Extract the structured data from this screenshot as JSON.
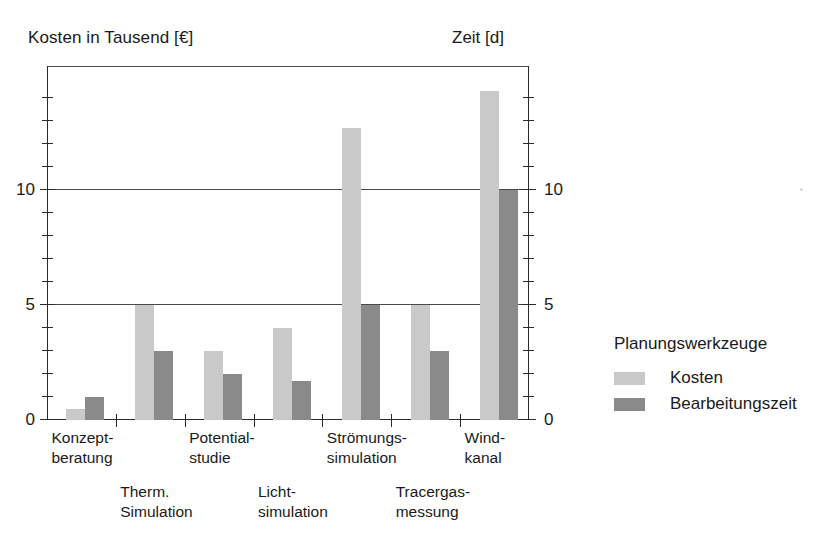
{
  "chart_data": {
    "type": "bar",
    "title": "",
    "ylabel": "Kosten in Tausend [€]",
    "y2label": "Zeit [d]",
    "xlabel": "",
    "ylim": [
      0,
      15.4
    ],
    "y2lim": [
      0,
      15.4
    ],
    "grid": true,
    "grid_values": [
      0,
      5,
      10
    ],
    "legend_position": "right",
    "legend_title": "Planungswerkzeuge",
    "y_ticks_major": [
      0,
      5,
      10
    ],
    "y_ticks_minor": [
      1,
      2,
      3,
      4,
      6,
      7,
      8,
      9,
      11,
      12,
      13,
      14
    ],
    "y_tick_labels": [
      "0",
      "5",
      "10"
    ],
    "y2_tick_labels": [
      "0",
      "5",
      "10"
    ],
    "categories": [
      "Konzept-beratung",
      "Therm. Simulation",
      "Potential-studie",
      "Licht-simulation",
      "Strömungs-simulation",
      "Tracergas-messung",
      "Wind-kanal"
    ],
    "category_lines": [
      {
        "line1": "Konzept-",
        "line2": "beratung",
        "row": "top"
      },
      {
        "line1": "Therm.",
        "line2": "Simulation",
        "row": "bottom"
      },
      {
        "line1": "Potential-",
        "line2": "studie",
        "row": "top"
      },
      {
        "line1": "Licht-",
        "line2": "simulation",
        "row": "bottom"
      },
      {
        "line1": "Strömungs-",
        "line2": "simulation",
        "row": "top"
      },
      {
        "line1": "Tracergas-",
        "line2": "messung",
        "row": "bottom"
      },
      {
        "line1": "Wind-",
        "line2": "kanal",
        "row": "top"
      }
    ],
    "series": [
      {
        "name": "Kosten",
        "color": "#c9c9c9",
        "axis": "left",
        "unit": "Tausend [€]",
        "values": [
          0.5,
          5,
          3,
          4,
          12.7,
          5,
          14.3
        ]
      },
      {
        "name": "Bearbeitungszeit",
        "color": "#8a8a8a",
        "axis": "right",
        "unit": "[d]",
        "values": [
          1,
          3,
          2,
          1.7,
          5,
          3,
          10
        ]
      }
    ]
  },
  "legend": {
    "title": "Planungswerkzeuge",
    "entries": [
      {
        "label": "Kosten",
        "color": "#c9c9c9"
      },
      {
        "label": "Bearbeitungszeit",
        "color": "#8a8a8a"
      }
    ]
  },
  "axes": {
    "left_title": "Kosten in Tausend [€]",
    "right_title": "Zeit [d]"
  }
}
